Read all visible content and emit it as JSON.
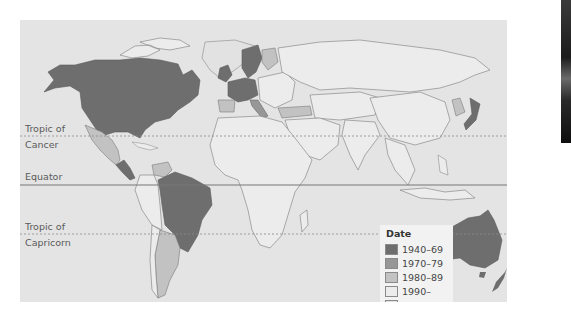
{
  "map": {
    "type": "choropleth-world",
    "background_color": "#e4e4e4",
    "latitude_lines": [
      {
        "name": "tropic-of-cancer",
        "label_line1": "Tropic of",
        "label_line2": "Cancer",
        "style": "dotted"
      },
      {
        "name": "equator",
        "label_line1": "Equator",
        "label_line2": "",
        "style": "solid"
      },
      {
        "name": "tropic-of-capricorn",
        "label_line1": "Tropic of",
        "label_line2": "Capricorn",
        "style": "dotted"
      }
    ]
  },
  "legend": {
    "title": "Date",
    "items": [
      {
        "label": "1940–69",
        "color": "#6e6e6e"
      },
      {
        "label": "1970–79",
        "color": "#979797"
      },
      {
        "label": "1980–89",
        "color": "#c2c2c2"
      },
      {
        "label": "1990–",
        "color": "#ececec"
      },
      {
        "label": "None",
        "color": "#e2e2e2"
      }
    ]
  },
  "regions": {
    "1940-69": [
      "United States",
      "Canada",
      "United Kingdom",
      "France",
      "Germany (West)",
      "Benelux",
      "Norway",
      "Sweden",
      "Denmark",
      "Australia",
      "New Zealand",
      "Japan",
      "Brazil",
      "Central America (part)"
    ],
    "1970-79": [
      "Portugal",
      "Italy",
      "Finland"
    ],
    "1980-89": [
      "Mexico",
      "Spain",
      "Turkey",
      "Argentina",
      "Venezuela",
      "Korea",
      "Chile"
    ],
    "1990-": [
      "Eastern Europe",
      "Russia",
      "China",
      "India",
      "Africa",
      "Middle East",
      "Southeast Asia",
      "Peru",
      "Bolivia",
      "Colombia"
    ]
  }
}
